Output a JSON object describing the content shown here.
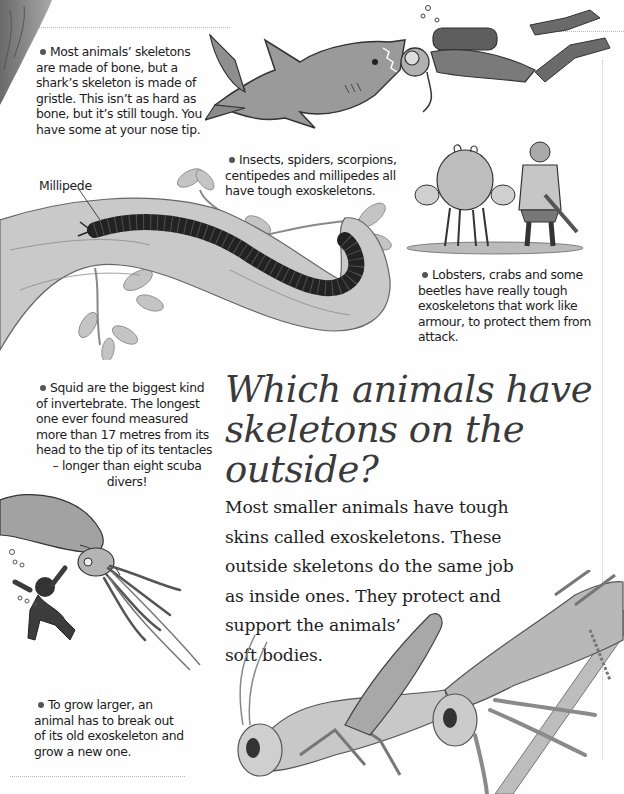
{
  "page": {
    "heading": {
      "line1": "Which animals have",
      "line2": "skeletons on the",
      "line3": "outside?"
    },
    "body_paragraph": {
      "lines": [
        "Most smaller animals have tough",
        "skins called exoskeletons. These",
        "outside skeletons do the same job",
        "as inside ones. They protect and",
        "support the animals’",
        "soft bodies."
      ]
    },
    "facts": {
      "shark": {
        "lines": [
          "Most animals’ skeletons",
          "are made of bone, but a",
          "shark’s skeleton is made of",
          "gristle. This isn’t as hard as",
          "bone, but it’s still tough. You",
          "have some at your nose tip."
        ]
      },
      "insects": {
        "lines": [
          "Insects, spiders, scorpions,",
          "centipedes and millipedes all",
          "have tough exoskeletons."
        ]
      },
      "lobsters": {
        "lines": [
          "Lobsters, crabs and some",
          "beetles have really tough",
          "exoskeletons that work like",
          "armour, to protect them from",
          "attack."
        ]
      },
      "squid": {
        "lines": [
          "Squid are the biggest kind",
          "of invertebrate. The longest",
          "one ever found measured",
          "more than 17 metres from its",
          "head to the tip of its tentacles",
          "– longer than eight scuba",
          "divers!"
        ]
      },
      "grow": {
        "lines": [
          "To grow larger, an",
          "animal has to break out",
          "of its old exoskeleton and",
          "grow a new one."
        ]
      }
    },
    "labels": {
      "millipede": "Millipede"
    },
    "illustrations": [
      "shark-chasing-diver",
      "crab-and-knight",
      "millipede-on-branch",
      "giant-squid-and-diver",
      "grasshopper-moulting",
      "tree-trunk-corner"
    ],
    "colors": {
      "text": "#1c1c1c",
      "heading": "#3a3a3a",
      "illustration_dark": "#2a2a2a",
      "illustration_mid": "#8a8a8a",
      "illustration_light": "#c8c8c8",
      "background": "#fefefe"
    }
  }
}
